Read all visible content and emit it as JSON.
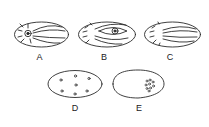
{
  "figure": {
    "stroke_color": "#2a2a2a",
    "background": "#ffffff",
    "panels": [
      {
        "id": "A",
        "label": "A",
        "description": "oval with spindle fibers and nucleus on left"
      },
      {
        "id": "B",
        "label": "B",
        "description": "oval with spindle fibers and nucleus on right (eye-shaped)"
      },
      {
        "id": "C",
        "label": "C",
        "description": "oval with spindle fibers, no nucleus"
      },
      {
        "id": "D",
        "label": "D",
        "description": "oval with 7 scattered dots"
      },
      {
        "id": "E",
        "label": "E",
        "description": "egg-shaped outline with cluster of dots on right"
      }
    ]
  }
}
